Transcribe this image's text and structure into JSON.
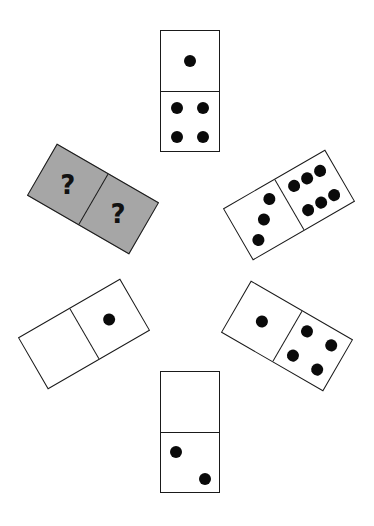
{
  "puzzle": {
    "type": "domino-sequence",
    "unknown_color": "#a6a6a6",
    "dominoes": [
      {
        "id": "top",
        "halves": [
          1,
          4
        ]
      },
      {
        "id": "upper-right",
        "halves": [
          3,
          6
        ]
      },
      {
        "id": "lower-right",
        "halves": [
          1,
          4
        ]
      },
      {
        "id": "bottom",
        "halves": [
          0,
          2
        ]
      },
      {
        "id": "lower-left",
        "halves": [
          0,
          1
        ]
      },
      {
        "id": "upper-left",
        "halves": [
          "?",
          "?"
        ]
      }
    ],
    "unknown_label": "?"
  }
}
